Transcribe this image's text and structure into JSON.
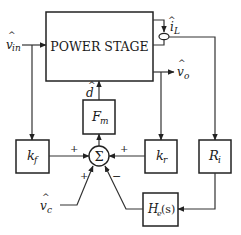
{
  "diagram": {
    "type": "control block diagram",
    "blocks": {
      "power_stage": {
        "label": "POWER STAGE"
      },
      "fm": {
        "label": "F",
        "sub": "m"
      },
      "kf": {
        "label": "k",
        "sub": "f"
      },
      "kr": {
        "label": "k",
        "sub": "r"
      },
      "ri": {
        "label": "R",
        "sub": "i"
      },
      "he": {
        "label": "H",
        "sub": "e",
        "tail": "(s)"
      },
      "sum": {
        "label": "Σ"
      }
    },
    "signals": {
      "vin": {
        "hat": "^",
        "base": "v",
        "sub": "in"
      },
      "il": {
        "hat": "^",
        "base": "i",
        "sub": "L"
      },
      "vo": {
        "hat": "^",
        "base": "v",
        "sub": "o"
      },
      "d": {
        "hat": "^",
        "base": "d"
      },
      "vc": {
        "hat": "^",
        "base": "v",
        "sub": "c"
      }
    },
    "signs": {
      "kf_in": "+",
      "kr_in": "+",
      "vc_in": "+",
      "he_in": "−"
    }
  }
}
